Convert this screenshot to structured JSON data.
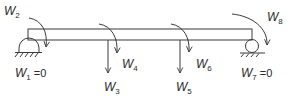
{
  "diagram": {
    "type": "beam-with-supports",
    "beam": {
      "left_support": "pin",
      "right_support": "roller"
    },
    "labels": {
      "w1": {
        "base": "W",
        "sub": "1",
        "suffix": " =0"
      },
      "w2": {
        "base": "W",
        "sub": "2"
      },
      "w3": {
        "base": "W",
        "sub": "3"
      },
      "w4": {
        "base": "W",
        "sub": "4"
      },
      "w5": {
        "base": "W",
        "sub": "5"
      },
      "w6": {
        "base": "W",
        "sub": "6"
      },
      "w7": {
        "base": "W",
        "sub": "7",
        "suffix": " =0"
      },
      "w8": {
        "base": "W",
        "sub": "8"
      }
    },
    "loads": [
      {
        "id": "w2",
        "kind": "moment",
        "location": "left-support"
      },
      {
        "id": "w3",
        "kind": "point-force-down",
        "location": "span-1/3"
      },
      {
        "id": "w4",
        "kind": "moment",
        "location": "span-1/3"
      },
      {
        "id": "w5",
        "kind": "point-force-down",
        "location": "span-2/3"
      },
      {
        "id": "w6",
        "kind": "moment",
        "location": "span-2/3"
      },
      {
        "id": "w8",
        "kind": "moment",
        "location": "right-support"
      }
    ],
    "boundary_conditions": [
      {
        "id": "w1",
        "value": "0",
        "support": "pin"
      },
      {
        "id": "w7",
        "value": "0",
        "support": "roller"
      }
    ],
    "colors": {
      "line": "#3a3a3a",
      "text": "#2a2a2a",
      "background": "#ffffff"
    }
  }
}
